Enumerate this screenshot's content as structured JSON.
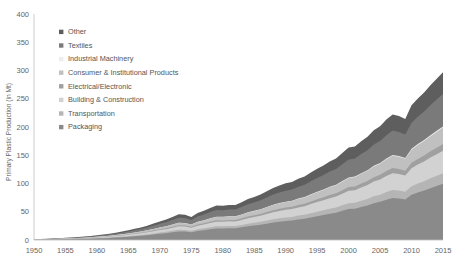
{
  "chart_data": {
    "type": "area",
    "stacked": true,
    "title": "",
    "xlabel": "",
    "ylabel": "Primary Plastic Production (in Mt)",
    "xlim": [
      1950,
      2015
    ],
    "ylim": [
      0,
      400
    ],
    "yticks": [
      0,
      50,
      100,
      150,
      200,
      250,
      300,
      350,
      400
    ],
    "xticks": [
      1950,
      1955,
      1960,
      1965,
      1970,
      1975,
      1980,
      1985,
      1990,
      1995,
      2000,
      2005,
      2010,
      2015
    ],
    "grid": false,
    "legend_position": "upper-left-inside",
    "legend_order_top_to_bottom": [
      "Other",
      "Textiles",
      "Industrial Machinery",
      "Consumer & Institutional Products",
      "Electrical/Electronic",
      "Building & Construction",
      "Transportation",
      "Packaging"
    ],
    "x": [
      1950,
      1951,
      1952,
      1953,
      1954,
      1955,
      1956,
      1957,
      1958,
      1959,
      1960,
      1961,
      1962,
      1963,
      1964,
      1965,
      1966,
      1967,
      1968,
      1969,
      1970,
      1971,
      1972,
      1973,
      1974,
      1975,
      1976,
      1977,
      1978,
      1979,
      1980,
      1981,
      1982,
      1983,
      1984,
      1985,
      1986,
      1987,
      1988,
      1989,
      1990,
      1991,
      1992,
      1993,
      1994,
      1995,
      1996,
      1997,
      1998,
      1999,
      2000,
      2001,
      2002,
      2003,
      2004,
      2005,
      2006,
      2007,
      2008,
      2009,
      2010,
      2011,
      2012,
      2013,
      2014,
      2015
    ],
    "series": [
      {
        "name": "Packaging",
        "color": "#8a8a8a",
        "values": [
          0.5,
          0.6,
          0.7,
          0.9,
          1.1,
          1.3,
          1.5,
          1.8,
          2.0,
          2.4,
          2.8,
          3.2,
          3.7,
          4.3,
          5.0,
          5.7,
          6.6,
          7.4,
          8.5,
          9.7,
          11.0,
          12.1,
          13.6,
          15.2,
          14.9,
          13.6,
          16.0,
          17.3,
          19.0,
          20.4,
          20.3,
          20.8,
          20.7,
          22.4,
          24.3,
          25.5,
          27.0,
          28.9,
          30.9,
          32.3,
          33.6,
          34.4,
          36.3,
          37.6,
          40.0,
          42.2,
          44.2,
          46.6,
          48.4,
          51.6,
          54.8,
          55.5,
          58.5,
          61.2,
          65.1,
          67.5,
          71.4,
          74.5,
          73.5,
          71.8,
          79.9,
          84.0,
          87.5,
          91.8,
          95.6,
          99.5
        ]
      },
      {
        "name": "Transportation",
        "color": "#b5b5b5",
        "values": [
          0.1,
          0.1,
          0.15,
          0.18,
          0.22,
          0.26,
          0.3,
          0.35,
          0.4,
          0.48,
          0.55,
          0.63,
          0.73,
          0.85,
          0.98,
          1.1,
          1.3,
          1.45,
          1.65,
          1.9,
          2.1,
          2.3,
          2.6,
          2.9,
          2.85,
          2.6,
          3.0,
          3.3,
          3.6,
          3.9,
          3.85,
          3.95,
          3.9,
          4.25,
          4.6,
          4.85,
          5.1,
          5.5,
          5.85,
          6.1,
          6.35,
          6.5,
          6.85,
          7.1,
          7.55,
          8.0,
          8.35,
          8.8,
          9.15,
          9.75,
          10.35,
          10.5,
          11.05,
          11.55,
          12.3,
          12.75,
          13.5,
          14.05,
          13.9,
          13.55,
          15.1,
          15.85,
          16.5,
          17.35,
          18.05,
          18.8
        ]
      },
      {
        "name": "Building & Construction",
        "color": "#d2d2d2",
        "values": [
          0.2,
          0.25,
          0.3,
          0.36,
          0.44,
          0.52,
          0.6,
          0.72,
          0.82,
          0.96,
          1.12,
          1.28,
          1.48,
          1.72,
          2.0,
          2.28,
          2.64,
          2.96,
          3.4,
          3.88,
          4.4,
          4.84,
          5.44,
          6.08,
          5.96,
          5.44,
          6.4,
          6.92,
          7.6,
          8.16,
          8.12,
          8.32,
          8.28,
          8.96,
          9.72,
          10.2,
          10.8,
          11.56,
          12.36,
          12.92,
          13.44,
          13.76,
          14.52,
          15.04,
          16.0,
          16.88,
          17.68,
          18.64,
          19.36,
          20.64,
          21.92,
          22.2,
          23.4,
          24.48,
          26.04,
          27.0,
          28.56,
          29.8,
          29.4,
          28.72,
          31.96,
          33.6,
          35.0,
          36.72,
          38.24,
          39.8
        ]
      },
      {
        "name": "Electrical/Electronic",
        "color": "#a0a0a0",
        "values": [
          0.06,
          0.07,
          0.09,
          0.11,
          0.13,
          0.15,
          0.18,
          0.21,
          0.24,
          0.29,
          0.33,
          0.38,
          0.44,
          0.52,
          0.6,
          0.68,
          0.79,
          0.89,
          1.02,
          1.16,
          1.32,
          1.45,
          1.63,
          1.82,
          1.79,
          1.63,
          1.92,
          2.08,
          2.28,
          2.45,
          2.44,
          2.5,
          2.48,
          2.69,
          2.92,
          3.06,
          3.24,
          3.47,
          3.71,
          3.88,
          4.03,
          4.13,
          4.36,
          4.51,
          4.8,
          5.06,
          5.3,
          5.59,
          5.81,
          6.19,
          6.58,
          6.66,
          7.02,
          7.34,
          7.81,
          8.1,
          8.57,
          8.94,
          8.82,
          8.62,
          9.59,
          10.08,
          10.5,
          11.02,
          11.47,
          11.94
        ]
      },
      {
        "name": "Consumer & Institutional Products",
        "color": "#c0c0c0",
        "values": [
          0.15,
          0.18,
          0.21,
          0.26,
          0.32,
          0.38,
          0.44,
          0.52,
          0.6,
          0.7,
          0.82,
          0.94,
          1.08,
          1.26,
          1.46,
          1.67,
          1.93,
          2.17,
          2.49,
          2.84,
          3.22,
          3.54,
          3.98,
          4.45,
          4.36,
          3.98,
          4.68,
          5.06,
          5.56,
          5.97,
          5.94,
          6.09,
          6.06,
          6.56,
          7.11,
          7.46,
          7.9,
          8.46,
          9.04,
          9.45,
          9.83,
          10.07,
          10.63,
          11.0,
          11.7,
          12.35,
          12.93,
          13.64,
          14.17,
          15.1,
          16.04,
          16.24,
          17.12,
          17.91,
          19.05,
          19.76,
          20.9,
          21.8,
          21.51,
          21.01,
          23.38,
          24.58,
          25.61,
          26.87,
          27.98,
          29.12
        ]
      },
      {
        "name": "Industrial Machinery",
        "color": "#ededed",
        "values": [
          0.01,
          0.012,
          0.014,
          0.017,
          0.021,
          0.025,
          0.029,
          0.034,
          0.039,
          0.046,
          0.054,
          0.062,
          0.071,
          0.083,
          0.096,
          0.11,
          0.127,
          0.143,
          0.164,
          0.187,
          0.212,
          0.233,
          0.262,
          0.293,
          0.287,
          0.262,
          0.308,
          0.333,
          0.366,
          0.393,
          0.391,
          0.401,
          0.399,
          0.432,
          0.468,
          0.491,
          0.52,
          0.557,
          0.595,
          0.622,
          0.647,
          0.663,
          0.7,
          0.724,
          0.771,
          0.813,
          0.851,
          0.898,
          0.933,
          0.994,
          1.056,
          1.069,
          1.127,
          1.179,
          1.254,
          1.301,
          1.376,
          1.435,
          1.416,
          1.383,
          1.539,
          1.618,
          1.686,
          1.769,
          1.842,
          1.917
        ]
      },
      {
        "name": "Textiles",
        "color": "#7a7a7a",
        "values": [
          0.3,
          0.36,
          0.43,
          0.52,
          0.63,
          0.75,
          0.87,
          1.04,
          1.18,
          1.39,
          1.61,
          1.85,
          2.14,
          2.49,
          2.89,
          3.3,
          3.82,
          4.28,
          4.92,
          5.61,
          6.36,
          7.0,
          7.86,
          8.79,
          8.62,
          7.86,
          9.25,
          10.0,
          10.98,
          11.8,
          11.74,
          12.03,
          11.97,
          12.95,
          14.05,
          14.74,
          15.61,
          16.71,
          17.86,
          18.67,
          19.42,
          19.89,
          20.99,
          21.73,
          23.12,
          24.39,
          25.55,
          26.94,
          27.98,
          29.83,
          31.69,
          32.09,
          33.82,
          35.38,
          37.63,
          39.03,
          41.28,
          43.06,
          42.49,
          41.51,
          46.19,
          48.56,
          50.58,
          53.07,
          55.27,
          57.52
        ]
      },
      {
        "name": "Other",
        "color": "#5e5e5e",
        "values": [
          0.2,
          0.24,
          0.29,
          0.35,
          0.42,
          0.5,
          0.58,
          0.69,
          0.79,
          0.93,
          1.08,
          1.24,
          1.43,
          1.66,
          1.93,
          2.2,
          2.55,
          2.86,
          3.28,
          3.74,
          4.24,
          4.67,
          5.24,
          5.86,
          5.75,
          5.24,
          6.17,
          6.67,
          7.32,
          7.87,
          7.83,
          8.02,
          7.98,
          8.64,
          9.37,
          9.83,
          10.41,
          11.14,
          11.91,
          12.45,
          12.95,
          13.26,
          14.0,
          14.49,
          15.42,
          16.26,
          17.03,
          17.96,
          18.65,
          19.89,
          21.13,
          21.4,
          22.55,
          23.59,
          25.09,
          26.02,
          27.52,
          28.71,
          28.33,
          27.68,
          30.79,
          32.37,
          33.72,
          35.38,
          36.85,
          38.35
        ]
      }
    ]
  },
  "axis": {
    "y_label": "Primary Plastic Production (in Mt)",
    "y_ticks": [
      "0",
      "50",
      "100",
      "150",
      "200",
      "250",
      "300",
      "350",
      "400"
    ],
    "x_ticks": [
      "1950",
      "1955",
      "1960",
      "1965",
      "1970",
      "1975",
      "1980",
      "1985",
      "1990",
      "1995",
      "2000",
      "2005",
      "2010",
      "2015"
    ]
  },
  "legend": {
    "items": [
      {
        "label": "Other",
        "color": "#5e5e5e"
      },
      {
        "label": "Textiles",
        "color": "#7a7a7a"
      },
      {
        "label": "Industrial Machinery",
        "color": "#ededed"
      },
      {
        "label": "Consumer & Institutional Products",
        "color": "#c0c0c0"
      },
      {
        "label": "Electrical/Electronic",
        "color": "#a0a0a0"
      },
      {
        "label": "Building & Construction",
        "color": "#d2d2d2"
      },
      {
        "label": "Transportation",
        "color": "#b5b5b5"
      },
      {
        "label": "Packaging",
        "color": "#8a8a8a"
      }
    ]
  }
}
